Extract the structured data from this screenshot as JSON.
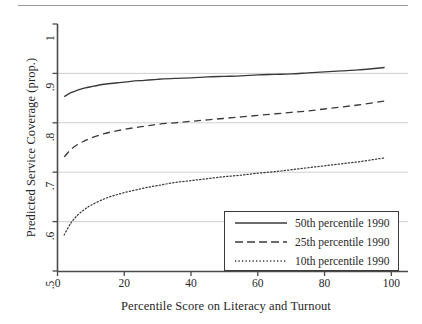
{
  "figure": {
    "has_top_rule": true
  },
  "chart_data": {
    "type": "line",
    "title": "",
    "xlabel": "Percentile Score on Literacy and Turnout",
    "ylabel": "Predicted Service Coverage (prop.)",
    "xlim": [
      0,
      105
    ],
    "ylim": [
      0.5,
      1.0
    ],
    "xticks": [
      0,
      20,
      40,
      60,
      80,
      100
    ],
    "xtick_labels": [
      "0",
      "20",
      "40",
      "60",
      "80",
      "100"
    ],
    "yticks": [
      0.5,
      0.6,
      0.7,
      0.8,
      0.9,
      1.0
    ],
    "ytick_labels": [
      ".5",
      ".6",
      ".7",
      ".8",
      ".9",
      "1"
    ],
    "grid": "horizontal",
    "gridlines_at": [
      0.6,
      0.7,
      0.8,
      0.9
    ],
    "legend_position": "lower right",
    "series": [
      {
        "name": "50th percentile 1990",
        "style": "solid",
        "color": "#3a3a3a",
        "x": [
          2,
          4,
          6,
          8,
          10,
          14,
          18,
          22,
          26,
          30,
          35,
          40,
          45,
          50,
          55,
          60,
          65,
          70,
          75,
          80,
          85,
          90,
          95,
          98
        ],
        "y": [
          0.853,
          0.861,
          0.866,
          0.87,
          0.873,
          0.878,
          0.881,
          0.884,
          0.886,
          0.888,
          0.89,
          0.891,
          0.893,
          0.894,
          0.895,
          0.897,
          0.898,
          0.899,
          0.901,
          0.903,
          0.905,
          0.907,
          0.91,
          0.912
        ]
      },
      {
        "name": "25th percentile 1990",
        "style": "dashed",
        "color": "#3a3a3a",
        "x": [
          2,
          4,
          6,
          8,
          10,
          14,
          18,
          22,
          26,
          30,
          35,
          40,
          45,
          50,
          55,
          60,
          65,
          70,
          75,
          80,
          85,
          90,
          95,
          98
        ],
        "y": [
          0.731,
          0.746,
          0.756,
          0.763,
          0.769,
          0.778,
          0.784,
          0.789,
          0.793,
          0.797,
          0.8,
          0.803,
          0.806,
          0.809,
          0.812,
          0.815,
          0.818,
          0.821,
          0.824,
          0.828,
          0.832,
          0.836,
          0.841,
          0.844
        ]
      },
      {
        "name": "10th percentile 1990",
        "style": "dotted",
        "color": "#3a3a3a",
        "x": [
          2,
          4,
          6,
          8,
          10,
          14,
          18,
          22,
          26,
          30,
          35,
          40,
          45,
          50,
          55,
          60,
          65,
          70,
          75,
          80,
          85,
          90,
          95,
          98
        ],
        "y": [
          0.573,
          0.597,
          0.613,
          0.624,
          0.633,
          0.646,
          0.655,
          0.662,
          0.668,
          0.673,
          0.679,
          0.683,
          0.687,
          0.691,
          0.694,
          0.698,
          0.701,
          0.705,
          0.709,
          0.713,
          0.717,
          0.721,
          0.726,
          0.729
        ]
      }
    ]
  },
  "legend": {
    "items": [
      {
        "label": "50th percentile 1990",
        "style": "solid"
      },
      {
        "label": "25th percentile 1990",
        "style": "dashed"
      },
      {
        "label": "10th percentile 1990",
        "style": "dotted"
      }
    ]
  }
}
